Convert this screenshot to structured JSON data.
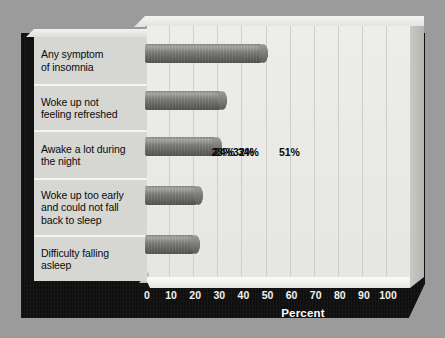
{
  "chart_data": {
    "type": "bar",
    "orientation": "horizontal",
    "title": "",
    "xlabel": "Percent",
    "ylabel": "",
    "xlim": [
      0,
      100
    ],
    "xticks": [
      "0",
      "10",
      "20",
      "30",
      "40",
      "50",
      "60",
      "70",
      "80",
      "90",
      "100"
    ],
    "grid": "vertical",
    "legend": "none",
    "categories": [
      "Any symptom of insomnia",
      "Woke up not feeling refreshed",
      "Awake a lot during the night",
      "Woke up too early and could not fall back to sleep",
      "Difficulty falling asleep"
    ],
    "values": [
      51,
      34,
      32,
      24,
      23
    ],
    "data_labels": [
      "51%",
      "34%",
      "32%",
      "24%",
      "23%"
    ],
    "colors": {
      "bar": "#7e7e7b",
      "plot_background": "#ededea",
      "gridline": "#cfcfca",
      "base": "#111010",
      "label_panel": "#d6d6d3",
      "outer_background": "#9b9b9b",
      "axis_text": "#f2f2f0",
      "value_text": "#0b0b0b"
    }
  },
  "labels": {
    "rows": [
      {
        "line1": "Any symptom",
        "line2": "of insomnia",
        "line3": ""
      },
      {
        "line1": "Woke up not",
        "line2": "feeling refreshed",
        "line3": ""
      },
      {
        "line1": "Awake a lot during",
        "line2": "the night",
        "line3": ""
      },
      {
        "line1": "Woke up too early",
        "line2": "and could not fall",
        "line3": "back to sleep"
      },
      {
        "line1": "Difficulty falling",
        "line2": "asleep",
        "line3": ""
      }
    ]
  }
}
